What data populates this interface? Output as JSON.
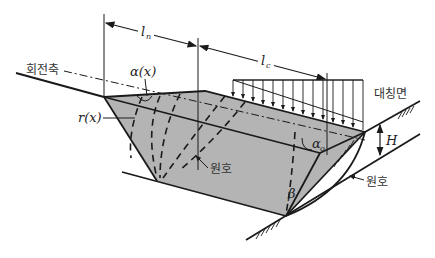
{
  "diagram": {
    "labels": {
      "rotation_axis": "회전축",
      "alpha_x": "α(x)",
      "r_x": "r(x)",
      "l_n_main": "l",
      "l_n_sub": "n",
      "l_c_main": "l",
      "l_c_sub": "c",
      "symmetry_plane": "대칭면",
      "height": "H",
      "alpha_o_main": "α",
      "alpha_o_sub": "o",
      "beta": "β",
      "arc_inner": "원호",
      "arc_outer": "원호"
    },
    "colors": {
      "block_fill": "#b4b4b4",
      "line": "#1a1a1a",
      "background": "#ffffff"
    },
    "load_arrow_count": 14
  }
}
